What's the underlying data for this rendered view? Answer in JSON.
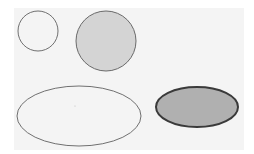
{
  "canvas": {
    "background": "#f4f4f4",
    "page_background": "#ffffff"
  },
  "shapes": [
    {
      "name": "small-circle",
      "type": "circle",
      "cx": 38,
      "cy": 31,
      "r": 20,
      "fill": "none",
      "stroke": "#707070",
      "stroke_width": 1
    },
    {
      "name": "gray-circle",
      "type": "circle",
      "cx": 106,
      "cy": 41,
      "r": 30,
      "fill": "#d4d4d4",
      "stroke": "#6a6a6a",
      "stroke_width": 1
    },
    {
      "name": "outline-ellipse",
      "type": "ellipse",
      "cx": 79,
      "cy": 116,
      "rx": 62,
      "ry": 30,
      "fill": "none",
      "stroke": "#707070",
      "stroke_width": 1
    },
    {
      "name": "dark-ellipse",
      "type": "ellipse",
      "cx": 197,
      "cy": 107,
      "rx": 41,
      "ry": 20,
      "fill": "#b0b0b0",
      "stroke": "#3a3a3a",
      "stroke_width": 2
    }
  ]
}
